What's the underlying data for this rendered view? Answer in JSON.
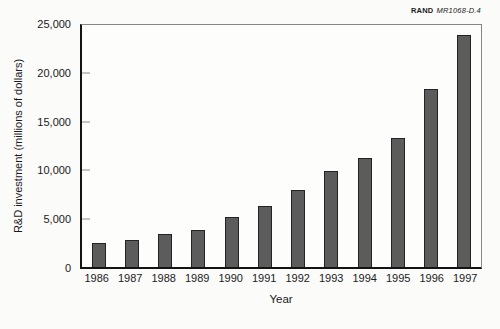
{
  "figure_tag": {
    "brand": "RAND",
    "id": "MR1068-D.4"
  },
  "chart_data": {
    "type": "bar",
    "title": "",
    "categories": [
      "1986",
      "1987",
      "1988",
      "1989",
      "1990",
      "1991",
      "1992",
      "1993",
      "1994",
      "1995",
      "1996",
      "1997"
    ],
    "values": [
      2400,
      2700,
      3300,
      3700,
      5100,
      6200,
      7900,
      9800,
      11200,
      13200,
      18300,
      23900
    ],
    "xlabel": "Year",
    "ylabel": "R&D investment (millions of dollars)",
    "ylim": [
      0,
      25000
    ],
    "yticks": [
      0,
      5000,
      10000,
      15000,
      20000,
      25000
    ],
    "ytick_labels": [
      "0",
      "5,000",
      "10,000",
      "15,000",
      "20,000",
      "25,000"
    ],
    "grid": false,
    "legend": false,
    "bar_color": "#5c5c5c",
    "bar_border_color": "#232323"
  }
}
